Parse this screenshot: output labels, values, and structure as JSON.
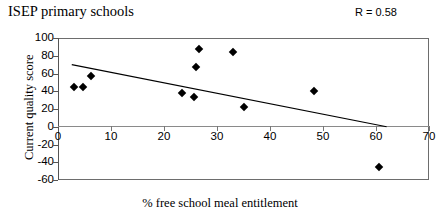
{
  "title": "ISEP primary schools",
  "r_label": "R = 0.58",
  "chart_data": {
    "type": "scatter",
    "title": "ISEP primary schools",
    "xlabel": "% free school meal entitlement",
    "ylabel": "Current quality score",
    "xlim": [
      0,
      70
    ],
    "ylim": [
      -60,
      100
    ],
    "xticks": [
      0,
      10,
      20,
      30,
      40,
      50,
      60,
      70
    ],
    "yticks": [
      100,
      80,
      60,
      40,
      20,
      0,
      -20,
      -40,
      -60
    ],
    "grid": false,
    "legend": false,
    "annotations": [
      "R = 0.58"
    ],
    "points": [
      {
        "x": 3.0,
        "y": 45
      },
      {
        "x": 4.7,
        "y": 45
      },
      {
        "x": 6.2,
        "y": 57
      },
      {
        "x": 23.4,
        "y": 38
      },
      {
        "x": 25.7,
        "y": 33
      },
      {
        "x": 26.0,
        "y": 67
      },
      {
        "x": 26.6,
        "y": 88
      },
      {
        "x": 33.0,
        "y": 84
      },
      {
        "x": 35.0,
        "y": 22
      },
      {
        "x": 48.3,
        "y": 40
      },
      {
        "x": 60.5,
        "y": -45
      }
    ],
    "trendline": {
      "x0": 2.6,
      "y0": 70,
      "x1": 62.0,
      "y1": 0
    }
  }
}
